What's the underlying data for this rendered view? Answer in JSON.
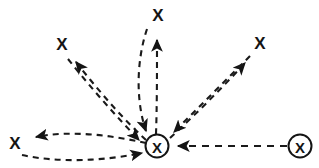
{
  "diagram": {
    "type": "node-link-diagram",
    "background_color": "#ffffff",
    "stroke_color": "#1a1a1a",
    "canvas": {
      "width": 319,
      "height": 168
    },
    "nodes": [
      {
        "id": "hub",
        "label": "X",
        "shape": "circled-x",
        "x": 157,
        "y": 146,
        "radius": 11.5,
        "role": "central-hub"
      },
      {
        "id": "left",
        "label": "X",
        "shape": "plain-x",
        "x": 15,
        "y": 143,
        "role": "leaf"
      },
      {
        "id": "upper-left",
        "label": "X",
        "shape": "plain-x",
        "x": 62,
        "y": 44,
        "role": "leaf"
      },
      {
        "id": "top",
        "label": "X",
        "shape": "plain-x",
        "x": 158,
        "y": 15,
        "role": "leaf"
      },
      {
        "id": "upper-right",
        "label": "X",
        "shape": "plain-x",
        "x": 260,
        "y": 43,
        "role": "leaf"
      },
      {
        "id": "right",
        "label": "X",
        "shape": "circled-x",
        "x": 300,
        "y": 146,
        "radius": 11.5,
        "role": "source"
      }
    ],
    "edges": [
      {
        "id": "edge-hub-left-out",
        "from": "hub",
        "to": "left",
        "direction": "outgoing",
        "style": "dashed",
        "arrow_at": "left",
        "path": "M 146 143 C 110 135, 70 130, 36 137"
      },
      {
        "id": "edge-left-hub-in",
        "from": "left",
        "to": "hub",
        "direction": "incoming",
        "style": "dashed",
        "arrow_at": "hub",
        "path": "M 22 155 C 58 163, 104 161, 142 153"
      },
      {
        "id": "edge-hub-upperleft-out",
        "from": "hub",
        "to": "upper-left",
        "direction": "outgoing",
        "style": "dashed",
        "arrow_at": "upper-left",
        "path": "M 146 140 C 122 118, 98 90, 76 62"
      },
      {
        "id": "edge-upperleft-hub-in",
        "from": "upper-left",
        "to": "hub",
        "direction": "incoming",
        "style": "dashed",
        "arrow_at": "hub",
        "path": "M 68 59 C 91 88, 116 116, 139 140"
      },
      {
        "id": "edge-hub-top-out",
        "from": "hub",
        "to": "top",
        "direction": "outgoing",
        "style": "dashed",
        "arrow_at": "top",
        "path": "M 156 134 C 157 106, 157 72, 157 40"
      },
      {
        "id": "edge-top-hub-in",
        "from": "top",
        "to": "hub",
        "direction": "incoming",
        "style": "dashed",
        "arrow_at": "hub",
        "path": "M 147 29 C 136 62, 136 102, 146 131"
      },
      {
        "id": "edge-hub-upperright-out",
        "from": "hub",
        "to": "upper-right",
        "direction": "outgoing",
        "style": "dashed",
        "arrow_at": "upper-right",
        "path": "M 170 138 C 196 114, 222 88, 245 63"
      },
      {
        "id": "edge-upperright-hub-in",
        "from": "upper-right",
        "to": "hub",
        "direction": "incoming",
        "style": "dashed",
        "arrow_at": "hub",
        "path": "M 250 56 C 226 80, 198 108, 174 132"
      },
      {
        "id": "edge-right-hub-in",
        "from": "right",
        "to": "hub",
        "direction": "incoming",
        "style": "dashed",
        "arrow_at": "hub",
        "path": "M 287 146 L 178 146"
      }
    ],
    "edge_count": 9,
    "bidirectional_pairs": 4,
    "unidirectional_edges": 1
  }
}
